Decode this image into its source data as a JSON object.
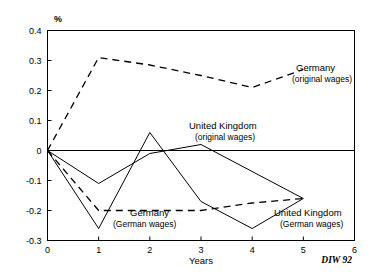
{
  "chart_data": {
    "type": "line",
    "title": "",
    "subtitle": "",
    "xlabel": "Years",
    "ylabel": "",
    "unit_label": "%",
    "xlim": [
      0,
      6
    ],
    "ylim": [
      -0.3,
      0.4
    ],
    "grid": false,
    "legend_position": "inline-annotations",
    "x": [
      0,
      1,
      2,
      3,
      4,
      5
    ],
    "xticks": [
      "0",
      "1",
      "2",
      "3",
      "4",
      "5",
      "6"
    ],
    "xtick_values": [
      0,
      1,
      2,
      3,
      4,
      5,
      6
    ],
    "yticks": [
      "0.4",
      "0.3",
      "0.2",
      "0.1",
      "0",
      "-0.1",
      "-0.2",
      "-0.3"
    ],
    "ytick_values": [
      0.4,
      0.3,
      0.2,
      0.1,
      0,
      -0.1,
      -0.2,
      -0.3
    ],
    "series": [
      {
        "name": "Germany (original wages)",
        "label_line1": "Germany",
        "label_line2": "(original wages)",
        "style": "dashed",
        "color": "#000000",
        "values": [
          0,
          0.31,
          0.285,
          0.25,
          0.21,
          0.27
        ]
      },
      {
        "name": "Germany (German wages)",
        "label_line1": "Germany",
        "label_line2": "(German wages)",
        "style": "dashed",
        "color": "#000000",
        "values": [
          0,
          -0.2,
          -0.2,
          -0.2,
          -0.175,
          -0.16
        ]
      },
      {
        "name": "United Kingdom (original wages)",
        "label_line1": "United Kingdom",
        "label_line2": "(original wages)",
        "style": "solid",
        "color": "#000000",
        "values": [
          0,
          -0.11,
          -0.01,
          0.02,
          -0.07,
          -0.16
        ]
      },
      {
        "name": "United Kingdom (German wages)",
        "label_line1": "United Kingdom",
        "label_line2": "(German wages)",
        "style": "solid",
        "color": "#000000",
        "values": [
          0,
          -0.26,
          0.06,
          -0.17,
          -0.26,
          -0.16
        ]
      }
    ],
    "credit": "DIW 92"
  }
}
